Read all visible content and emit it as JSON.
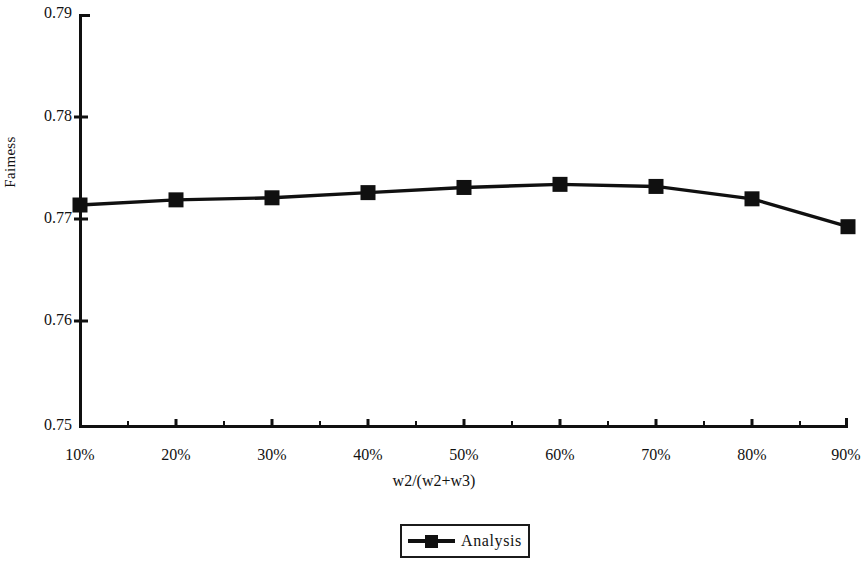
{
  "chart_data": {
    "type": "line",
    "title": "",
    "xlabel": "w2/(w2+w3)",
    "ylabel": "Faimess",
    "categories": [
      "10%",
      "20%",
      "30%",
      "40%",
      "50%",
      "60%",
      "70%",
      "80%",
      "90%"
    ],
    "x": [
      10,
      20,
      30,
      40,
      50,
      60,
      70,
      80,
      90
    ],
    "series": [
      {
        "name": "Analysis",
        "marker": "square",
        "color": "#101010",
        "values": [
          0.7715,
          0.772,
          0.7722,
          0.7727,
          0.7732,
          0.7735,
          0.7733,
          0.7721,
          0.7694
        ]
      }
    ],
    "ylim": [
      0.75,
      0.79
    ],
    "yticks": [
      "0.75",
      "0.76",
      "0.77",
      "0.78",
      "0.79"
    ],
    "ytick_values": [
      0.75,
      0.76,
      0.77,
      0.78,
      0.79
    ],
    "xlim": [
      10,
      90
    ],
    "xticks": [
      "10%",
      "20%",
      "30%",
      "40%",
      "50%",
      "60%",
      "70%",
      "80%",
      "90%"
    ],
    "minor_ticks_between": 1,
    "grid": false,
    "legend_position": "bottom-center",
    "legend_entries": [
      "Analysis"
    ],
    "axis_color": "#101010",
    "background": "#ffffff"
  },
  "axes": {
    "y_label": "Faimess",
    "x_label": "w2/(w2+w3)",
    "y_ticks": [
      "0.79",
      "0.78",
      "0.77",
      "0.76",
      "0.75"
    ],
    "x_ticks": [
      "10%",
      "20%",
      "30%",
      "40%",
      "50%",
      "60%",
      "70%",
      "80%",
      "90%"
    ]
  },
  "legend": {
    "label": "Analysis"
  }
}
